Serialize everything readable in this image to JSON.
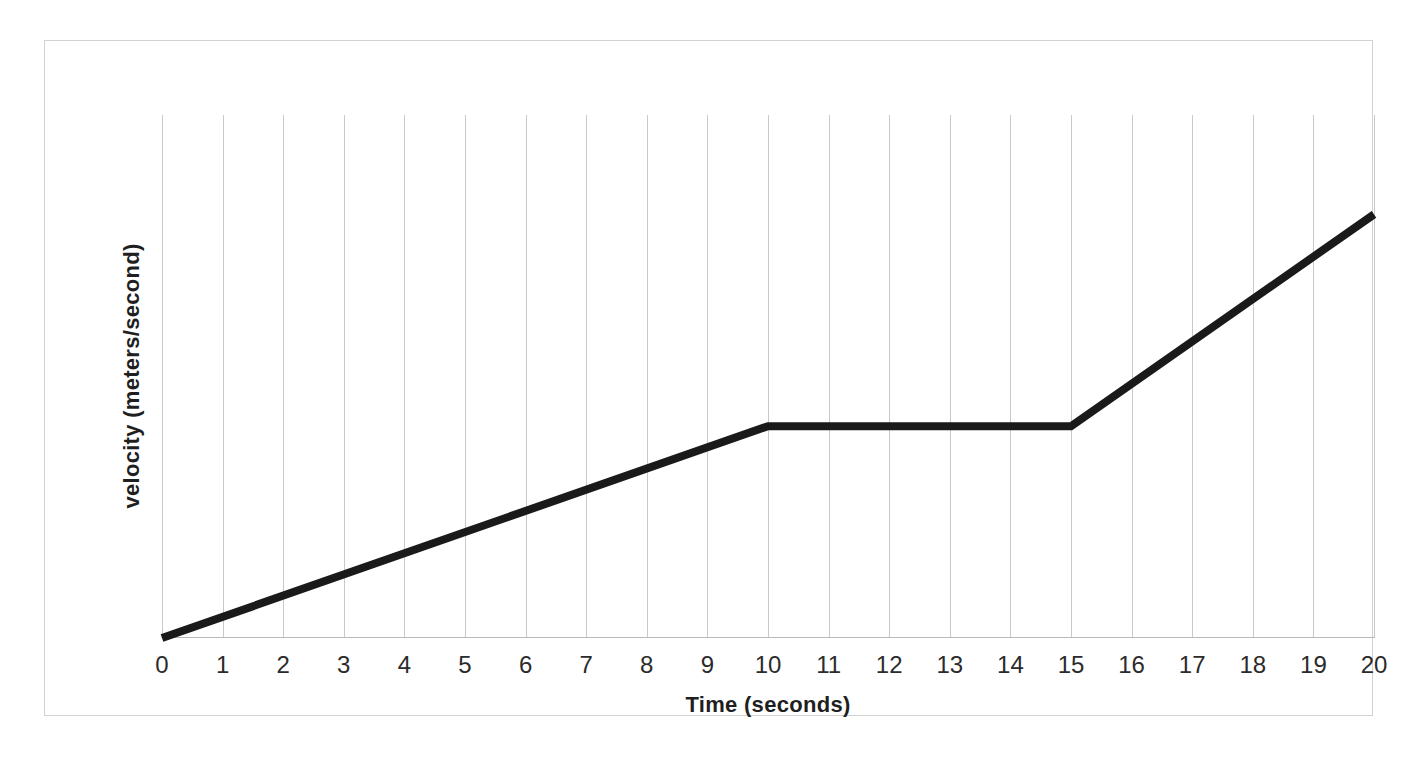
{
  "chart_data": {
    "type": "line",
    "title": "",
    "subtitle": "",
    "xlabel": "Time (seconds)",
    "ylabel": "velocity (meters/second)",
    "xlim": [
      0,
      20
    ],
    "ylim": [
      0,
      10
    ],
    "xticks": [
      "0",
      "1",
      "2",
      "3",
      "4",
      "5",
      "6",
      "7",
      "8",
      "9",
      "10",
      "11",
      "12",
      "13",
      "14",
      "15",
      "16",
      "17",
      "18",
      "19",
      "20"
    ],
    "yticks": [],
    "grid": "vertical-only",
    "legend": "none",
    "annotations": [],
    "series": [
      {
        "name": "velocity",
        "color": "#1a1a1a",
        "line_width": 8,
        "x": [
          0,
          10,
          15,
          20
        ],
        "y": [
          0,
          4.05,
          4.05,
          8.1
        ],
        "description": "Velocity increases linearly from 0 to 10 s, stays constant from 10 to 15 s, then increases linearly again more steeply from 15 to 20 s."
      }
    ]
  },
  "axes": {
    "x_title": "Time (seconds)",
    "y_title": "velocity (meters/second)"
  },
  "colors": {
    "series_line": "#1a1a1a",
    "gridline": "#c9c9c9",
    "axis_line": "#b9b9b9",
    "frame_border": "#d2d2d2",
    "background": "#ffffff",
    "tick_label": "#2b2b2b",
    "axis_title": "#1f1f1f"
  }
}
